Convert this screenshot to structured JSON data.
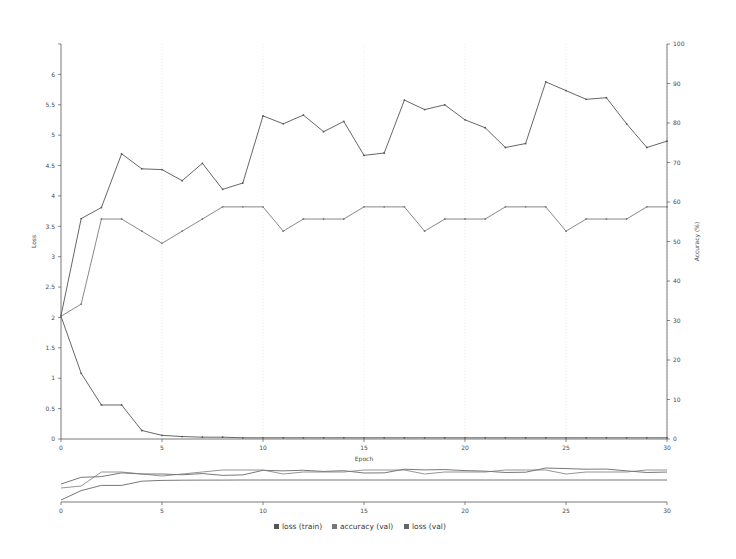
{
  "chart_data": {
    "type": "line",
    "title": "",
    "xlabel": "Epoch",
    "ylabel": "Loss",
    "y2label": "Accuracy (%)",
    "xlim": [
      0,
      30
    ],
    "ylim": [
      0,
      6.5
    ],
    "y2lim": [
      0,
      100
    ],
    "grid": true,
    "legend_position": "bottom-center",
    "x": [
      0,
      1,
      2,
      3,
      4,
      5,
      6,
      7,
      8,
      9,
      10,
      11,
      12,
      13,
      14,
      15,
      16,
      17,
      18,
      19,
      20,
      21,
      22,
      23,
      24,
      25,
      26,
      27,
      28,
      29,
      30
    ],
    "xticks": [
      0,
      5,
      10,
      15,
      20,
      25,
      30
    ],
    "xtick_labels": [
      "0",
      "5",
      "10",
      "15",
      "20",
      "25",
      "30"
    ],
    "yticks": [
      0,
      0.5,
      1,
      1.5,
      2,
      2.5,
      3,
      3.5,
      4,
      4.5,
      5,
      5.5,
      6
    ],
    "ytick_labels": [
      "0",
      "0.5",
      "1",
      "1.5",
      "2",
      "2.5",
      "3",
      "3.5",
      "4",
      "4.5",
      "5",
      "5.5",
      "6"
    ],
    "y2ticks": [
      0,
      10,
      20,
      30,
      40,
      50,
      60,
      70,
      80,
      90,
      100
    ],
    "y2tick_labels": [
      "0",
      "10",
      "20",
      "30",
      "40",
      "50",
      "60",
      "70",
      "80",
      "90",
      "100"
    ],
    "series": [
      {
        "name": "loss (train)",
        "axis": "left",
        "color": "#555555",
        "values": [
          2.02,
          1.08,
          0.56,
          0.56,
          0.14,
          0.06,
          0.04,
          0.03,
          0.03,
          0.02,
          0.02,
          0.02,
          0.02,
          0.02,
          0.02,
          0.02,
          0.02,
          0.02,
          0.02,
          0.02,
          0.02,
          0.02,
          0.02,
          0.02,
          0.02,
          0.02,
          0.02,
          0.02,
          0.02,
          0.02,
          0.02
        ]
      },
      {
        "name": "accuracy (val)",
        "axis": "right",
        "color": "#555555",
        "values": [
          31.2,
          55.8,
          58.6,
          72.2,
          68.4,
          68.2,
          65.4,
          69.8,
          63.2,
          64.8,
          81.8,
          79.8,
          82.0,
          77.8,
          80.4,
          71.8,
          72.4,
          85.8,
          83.4,
          84.6,
          80.8,
          78.8,
          73.8,
          74.8,
          90.4,
          88.2,
          86.0,
          86.4,
          79.8,
          73.8,
          75.4
        ]
      },
      {
        "name": "loss (val)",
        "axis": "left",
        "color": "#7a7a7a",
        "values": [
          2.02,
          2.22,
          3.62,
          3.62,
          3.42,
          3.22,
          3.42,
          3.62,
          3.82,
          3.82,
          3.82,
          3.42,
          3.62,
          3.62,
          3.62,
          3.82,
          3.82,
          3.82,
          3.42,
          3.62,
          3.62,
          3.62,
          3.82,
          3.82,
          3.82,
          3.42,
          3.62,
          3.62,
          3.62,
          3.82,
          3.82
        ]
      }
    ],
    "legend": [
      {
        "label": "loss (train)",
        "color": "#555555"
      },
      {
        "label": "accuracy (val)",
        "color": "#777777"
      },
      {
        "label": "loss (val)",
        "color": "#666666"
      }
    ],
    "overview_panel": {
      "present": true,
      "xticks": [
        0,
        5,
        10,
        15,
        20,
        25,
        30
      ],
      "xtick_labels": [
        "0",
        "5",
        "10",
        "15",
        "20",
        "25",
        "30"
      ]
    }
  }
}
